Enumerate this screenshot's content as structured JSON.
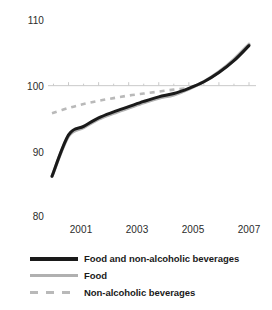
{
  "chart_data": {
    "type": "line",
    "title": "",
    "subtitle": "",
    "xlabel": "",
    "ylabel": "",
    "xlim": [
      2000.45,
      2007.0
    ],
    "ylim": [
      80,
      110
    ],
    "yticks": [
      110,
      100,
      90,
      80
    ],
    "ytick_labels": [
      "110",
      "100",
      "90",
      "80"
    ],
    "xticks": [
      2001,
      2003,
      2005,
      2007
    ],
    "xtick_labels": [
      "2001",
      "2003",
      "2005",
      "2007"
    ],
    "grid": "single horizontal gridline at 100 with minor ticks",
    "gridline_value": 100,
    "legend_position": "below-plot-left",
    "series": [
      {
        "name": "Food and non-alcoholic beverages",
        "style": "solid",
        "color": "#1a1a1a",
        "width": 3.0,
        "x": [
          2000.45,
          2001.0,
          2001.5,
          2002.0,
          2002.5,
          2003.0,
          2003.5,
          2004.0,
          2004.5,
          2005.0,
          2005.5,
          2006.0,
          2006.5,
          2007.0
        ],
        "values": [
          86.2,
          92.5,
          93.8,
          95.1,
          96.0,
          96.8,
          97.6,
          98.3,
          98.8,
          99.6,
          100.6,
          102.0,
          103.8,
          106.1
        ]
      },
      {
        "name": "Food",
        "style": "solid",
        "color": "#b0b0b0",
        "width": 3.2,
        "x": [
          2000.45,
          2001.0,
          2001.5,
          2002.0,
          2002.5,
          2003.0,
          2003.5,
          2004.0,
          2004.5,
          2005.0,
          2005.5,
          2006.0,
          2006.5,
          2007.0
        ],
        "values": [
          86.2,
          92.3,
          93.6,
          94.9,
          95.8,
          96.6,
          97.4,
          98.1,
          98.6,
          99.5,
          100.6,
          102.1,
          104.0,
          106.3
        ]
      },
      {
        "name": "Non-alcoholic beverages",
        "style": "dashed",
        "color": "#b9b9b9",
        "width": 2.6,
        "x": [
          2000.45,
          2001.0,
          2001.5,
          2002.0,
          2002.5,
          2003.0,
          2003.5,
          2004.0,
          2004.5,
          2005.0
        ],
        "values": [
          95.8,
          96.6,
          97.2,
          97.7,
          98.1,
          98.5,
          98.8,
          99.1,
          99.4,
          99.6
        ]
      }
    ]
  },
  "axis": {
    "y_labels": [
      {
        "text": "110",
        "value": 110
      },
      {
        "text": "100",
        "value": 100
      },
      {
        "text": "90",
        "value": 90
      },
      {
        "text": "80",
        "value": 80
      }
    ],
    "x_labels": [
      {
        "text": "2001",
        "value": 2001
      },
      {
        "text": "2003",
        "value": 2003
      },
      {
        "text": "2005",
        "value": 2005
      },
      {
        "text": "2007",
        "value": 2007
      }
    ]
  },
  "legend": {
    "items": [
      {
        "label": "Food and non-alcoholic beverages",
        "style": "solid-dark",
        "color": "#1a1a1a"
      },
      {
        "label": "Food",
        "style": "solid-gray",
        "color": "#b0b0b0"
      },
      {
        "label": "Non-alcoholic beverages",
        "style": "dashed",
        "color": "#b9b9b9"
      }
    ]
  },
  "colors": {
    "background": "#ffffff",
    "text": "#231f20",
    "gridline": "#c9c9c9",
    "series_dark": "#1a1a1a",
    "series_gray": "#b0b0b0",
    "series_dashed": "#b9b9b9"
  }
}
